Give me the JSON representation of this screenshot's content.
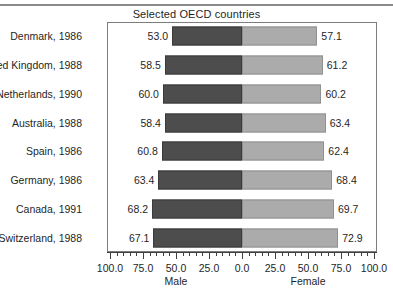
{
  "chart_data": {
    "type": "bar",
    "title": "Selected OECD countries",
    "orientation": "horizontal-diverging",
    "categories": [
      "Denmark, 1986",
      "United Kingdom, 1988",
      "Netherlands, 1990",
      "Australia, 1988",
      "Spain, 1986",
      "Germany, 1986",
      "Canada, 1991",
      "Switzerland, 1988"
    ],
    "series": [
      {
        "name": "Male",
        "side": "left",
        "color": "#4d4d4d",
        "values": [
          53.0,
          58.5,
          60.0,
          58.4,
          60.8,
          63.4,
          68.2,
          67.1
        ],
        "labels": [
          "53.0",
          "58.5",
          "60.0",
          "58.4",
          "60.8",
          "63.4",
          "68.2",
          "67.1"
        ]
      },
      {
        "name": "Female",
        "side": "right",
        "color": "#ababab",
        "values": [
          57.1,
          61.2,
          60.2,
          63.4,
          62.4,
          68.4,
          69.7,
          72.9
        ],
        "labels": [
          "57.1",
          "61.2",
          "60.2",
          "63.4",
          "62.4",
          "68.4",
          "69.7",
          "72.9"
        ]
      }
    ],
    "xlabel_left": "Male",
    "xlabel_right": "Female",
    "ylabel": "",
    "xlim": [
      -100.0,
      100.0
    ],
    "xticks": [
      -100.0,
      -75.0,
      -50.0,
      -25.0,
      0.0,
      25.0,
      50.0,
      75.0,
      100.0
    ],
    "xtick_labels": [
      "100.0",
      "75.0",
      "50.0",
      "25.0",
      "0.0",
      "25.0",
      "50.0",
      "75.0",
      "100.0"
    ],
    "minor_ticks_per_interval": 5,
    "grid": false,
    "legend": "none",
    "frame": true
  }
}
